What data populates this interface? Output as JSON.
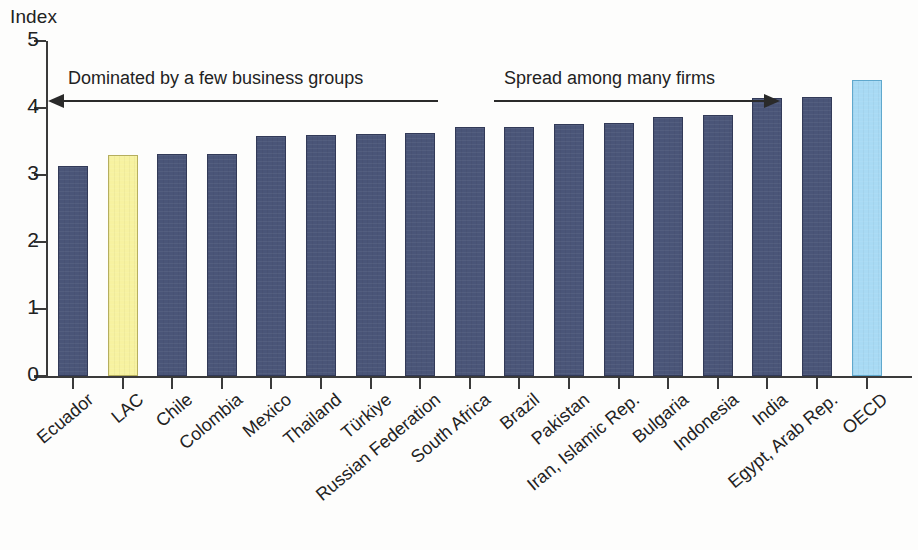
{
  "chart_data": {
    "type": "bar",
    "title": "",
    "ylabel": "Index",
    "xlabel": "",
    "ylim": [
      0,
      5
    ],
    "yticks": [
      "0",
      "1",
      "2",
      "3",
      "4",
      "5"
    ],
    "grid": false,
    "legend": null,
    "categories": [
      "Ecuador",
      "LAC",
      "Chile",
      "Colombia",
      "Mexico",
      "Thailand",
      "Türkiye",
      "Russian Federation",
      "South Africa",
      "Brazil",
      "Pakistan",
      "Iran, Islamic Rep.",
      "Bulgaria",
      "Indonesia",
      "India",
      "Egypt, Arab Rep.",
      "OECD"
    ],
    "values": [
      3.13,
      3.3,
      3.32,
      3.32,
      3.58,
      3.59,
      3.61,
      3.62,
      3.72,
      3.72,
      3.76,
      3.78,
      3.86,
      3.9,
      4.15,
      4.17,
      4.42
    ],
    "bar_colors": [
      "#4a5578",
      "#f7f2a0",
      "#4a5578",
      "#4a5578",
      "#4a5578",
      "#4a5578",
      "#4a5578",
      "#4a5578",
      "#4a5578",
      "#4a5578",
      "#4a5578",
      "#4a5578",
      "#4a5578",
      "#4a5578",
      "#4a5578",
      "#4a5578",
      "#a8daf4"
    ],
    "annotations": [
      {
        "text": "Dominated by a few business groups",
        "arrow": "left"
      },
      {
        "text": "Spread among many firms",
        "arrow": "right"
      }
    ],
    "colors": {
      "bar_default": "#4a5578",
      "bar_highlight_lac": "#f7f2a0",
      "bar_highlight_oecd": "#a8daf4",
      "axis": "#3a3a3a",
      "text": "#222222",
      "background": "#fdfdfc"
    }
  }
}
